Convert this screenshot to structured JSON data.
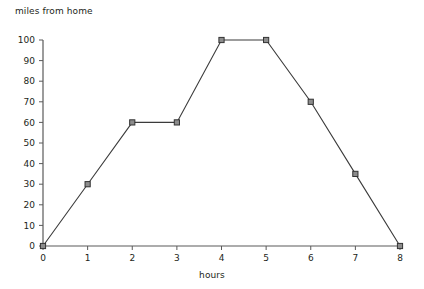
{
  "chart_data": {
    "type": "line",
    "title": "",
    "xlabel": "hours",
    "ylabel": "miles from home",
    "x": [
      0,
      1,
      2,
      3,
      4,
      5,
      6,
      7,
      8
    ],
    "values": [
      0,
      30,
      60,
      60,
      100,
      100,
      70,
      35,
      0
    ],
    "series": [
      {
        "name": "miles from home",
        "values": [
          0,
          30,
          60,
          60,
          100,
          100,
          70,
          35,
          0
        ]
      }
    ],
    "xlim": [
      0,
      8
    ],
    "ylim": [
      0,
      100
    ],
    "xticks": [
      "0",
      "1",
      "2",
      "3",
      "4",
      "5",
      "6",
      "7",
      "8"
    ],
    "yticks": [
      "0",
      "10",
      "20",
      "30",
      "40",
      "50",
      "60",
      "70",
      "80",
      "90",
      "100"
    ],
    "grid": false,
    "legend": null,
    "marker": "square",
    "colors": {
      "line": "#3b3b3b",
      "marker_fill": "#8c8c8c",
      "marker_stroke": "#333333",
      "axis": "#5a5a5a",
      "text": "#231f20",
      "background": "#ffffff"
    }
  }
}
